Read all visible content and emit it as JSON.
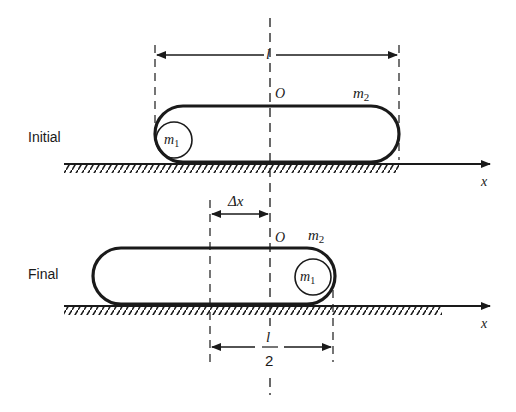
{
  "diagram": {
    "type": "physics-schematic",
    "initial": {
      "label": "Initial",
      "length_label": "l",
      "origin_label": "O",
      "cart_mass_label": "m",
      "cart_mass_sub": "2",
      "ball_mass_label": "m",
      "ball_mass_sub": "1",
      "axis_label": "x"
    },
    "final": {
      "label": "Final",
      "shift_label": "Δx",
      "origin_label": "O",
      "cart_mass_label": "m",
      "cart_mass_sub": "2",
      "ball_mass_label": "m",
      "ball_mass_sub": "1",
      "axis_label": "x",
      "half_length_num": "l",
      "half_length_den": "2"
    },
    "colors": {
      "ink": "#1a1a1a",
      "background": "#ffffff"
    }
  }
}
